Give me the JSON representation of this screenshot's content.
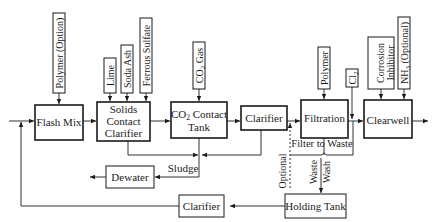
{
  "diagram": {
    "type": "process-flow",
    "units": {
      "flash_mix": "Flash Mix",
      "solids_contact_1": "Solids",
      "solids_contact_2": "Contact",
      "solids_contact_3": "Clarifier",
      "co2_tank_1": "CO",
      "co2_tank_sub": "2",
      "co2_tank_2": " Contact",
      "co2_tank_3": "Tank",
      "clarifier": "Clarifier",
      "filtration": "Filtration",
      "clearwell": "Clearwell",
      "dewater": "Dewater",
      "holding_tank": "Holding Tank",
      "recycle_clarifier": "Clarifier"
    },
    "chemicals": {
      "polymer_option": "Polymer (Option)",
      "lime": "Lime",
      "soda_ash": "Soda Ash",
      "ferrous_sulfate": "Ferrous Sulfate",
      "co2_gas_1": "CO",
      "co2_gas_sub": "2",
      "co2_gas_2": " Gas",
      "polymer": "Polymer",
      "cl2_1": "Cl",
      "cl2_sub": "2",
      "corrosion_1": "Corrosion",
      "corrosion_2": "Inhibitor",
      "nh3_1": "NH",
      "nh3_sub": "3",
      "nh3_2": " (Optional)"
    },
    "labels": {
      "sludge": "Sludge",
      "filter_to_waste": "Filter to Waste",
      "optional": "Optional",
      "waste": "Waste",
      "wash": "Wash"
    },
    "colors": {
      "line": "#1a1a1a",
      "background": "#ffffff"
    }
  }
}
